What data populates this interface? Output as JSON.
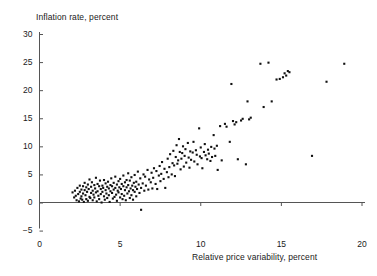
{
  "chart_data": {
    "type": "scatter",
    "title": "",
    "xlabel": "Relative price variability, percent",
    "ylabel": "Inflation rate, percent",
    "xlim": [
      0,
      20
    ],
    "ylim": [
      -5,
      30
    ],
    "xticks": [
      0,
      5,
      10,
      15,
      20
    ],
    "yticks": [
      -5,
      0,
      5,
      10,
      15,
      20,
      25,
      30
    ],
    "xtick_labels": [
      "0",
      "5",
      "10",
      "15",
      "20"
    ],
    "ytick_labels": [
      "−5",
      "0",
      "5",
      "10",
      "15",
      "20",
      "25",
      "30"
    ],
    "grid": false,
    "legend": "none",
    "zero_line": true,
    "marker": "filled-square",
    "marker_color": "#111111",
    "marker_size_px": 2.1,
    "n_points": 231,
    "points": [
      [
        2.05,
        1.8
      ],
      [
        2.15,
        0.9
      ],
      [
        2.2,
        2.1
      ],
      [
        2.25,
        1.2
      ],
      [
        2.3,
        0.4
      ],
      [
        2.35,
        2.6
      ],
      [
        2.4,
        1.5
      ],
      [
        2.45,
        0.2
      ],
      [
        2.5,
        1.9
      ],
      [
        2.5,
        3.0
      ],
      [
        2.55,
        0.7
      ],
      [
        2.6,
        2.3
      ],
      [
        2.6,
        1.1
      ],
      [
        2.65,
        0.5
      ],
      [
        2.7,
        2.9
      ],
      [
        2.7,
        1.6
      ],
      [
        2.75,
        0.1
      ],
      [
        2.8,
        2.2
      ],
      [
        2.8,
        3.5
      ],
      [
        2.85,
        1.3
      ],
      [
        2.9,
        0.6
      ],
      [
        2.9,
        2.7
      ],
      [
        2.95,
        1.9
      ],
      [
        3.0,
        0.3
      ],
      [
        3.0,
        3.2
      ],
      [
        3.05,
        2.4
      ],
      [
        3.1,
        1.0
      ],
      [
        3.1,
        4.1
      ],
      [
        3.15,
        0.8
      ],
      [
        3.2,
        2.8
      ],
      [
        3.2,
        1.7
      ],
      [
        3.25,
        3.6
      ],
      [
        3.3,
        0.4
      ],
      [
        3.3,
        2.1
      ],
      [
        3.35,
        1.4
      ],
      [
        3.4,
        3.1
      ],
      [
        3.4,
        0.9
      ],
      [
        3.45,
        2.5
      ],
      [
        3.5,
        1.8
      ],
      [
        3.5,
        4.4
      ],
      [
        3.55,
        0.2
      ],
      [
        3.6,
        3.3
      ],
      [
        3.6,
        2.0
      ],
      [
        3.65,
        1.2
      ],
      [
        3.7,
        2.9
      ],
      [
        3.7,
        0.6
      ],
      [
        3.75,
        3.9
      ],
      [
        3.8,
        1.5
      ],
      [
        3.8,
        2.4
      ],
      [
        3.85,
        0.0
      ],
      [
        3.9,
        3.0
      ],
      [
        3.9,
        1.9
      ],
      [
        3.95,
        2.6
      ],
      [
        4.0,
        1.1
      ],
      [
        4.0,
        4.0
      ],
      [
        4.05,
        0.5
      ],
      [
        4.1,
        2.2
      ],
      [
        4.1,
        3.4
      ],
      [
        4.15,
        1.6
      ],
      [
        4.2,
        2.8
      ],
      [
        4.2,
        0.8
      ],
      [
        4.25,
        3.7
      ],
      [
        4.3,
        1.3
      ],
      [
        4.3,
        2.5
      ],
      [
        4.35,
        0.1
      ],
      [
        4.4,
        3.1
      ],
      [
        4.4,
        2.0
      ],
      [
        4.45,
        4.3
      ],
      [
        4.5,
        1.7
      ],
      [
        4.5,
        2.9
      ],
      [
        4.55,
        0.7
      ],
      [
        4.6,
        3.5
      ],
      [
        4.6,
        2.3
      ],
      [
        4.65,
        1.0
      ],
      [
        4.7,
        4.6
      ],
      [
        4.7,
        2.6
      ],
      [
        4.75,
        1.4
      ],
      [
        4.8,
        3.2
      ],
      [
        4.8,
        0.3
      ],
      [
        4.85,
        2.1
      ],
      [
        4.9,
        3.8
      ],
      [
        4.9,
        1.8
      ],
      [
        4.95,
        2.7
      ],
      [
        5.0,
        0.9
      ],
      [
        5.0,
        4.2
      ],
      [
        5.05,
        2.4
      ],
      [
        5.1,
        1.5
      ],
      [
        5.1,
        3.3
      ],
      [
        5.15,
        0.6
      ],
      [
        5.2,
        2.9
      ],
      [
        5.2,
        4.8
      ],
      [
        5.25,
        1.2
      ],
      [
        5.3,
        3.6
      ],
      [
        5.3,
        2.2
      ],
      [
        5.35,
        0.4
      ],
      [
        5.4,
        4.0
      ],
      [
        5.4,
        2.7
      ],
      [
        5.45,
        1.6
      ],
      [
        5.5,
        3.1
      ],
      [
        5.5,
        5.2
      ],
      [
        5.55,
        2.0
      ],
      [
        5.6,
        0.8
      ],
      [
        5.6,
        3.9
      ],
      [
        5.65,
        2.5
      ],
      [
        5.7,
        1.3
      ],
      [
        5.7,
        4.5
      ],
      [
        5.75,
        3.0
      ],
      [
        5.8,
        2.2
      ],
      [
        5.8,
        0.5
      ],
      [
        5.85,
        3.5
      ],
      [
        5.9,
        1.9
      ],
      [
        5.9,
        4.9
      ],
      [
        5.95,
        2.8
      ],
      [
        6.0,
        1.1
      ],
      [
        6.0,
        3.7
      ],
      [
        6.05,
        2.4
      ],
      [
        6.1,
        5.5
      ],
      [
        6.15,
        3.2
      ],
      [
        6.2,
        1.7
      ],
      [
        6.25,
        4.3
      ],
      [
        6.3,
        2.6
      ],
      [
        6.3,
        -1.3
      ],
      [
        6.4,
        3.4
      ],
      [
        6.45,
        5.0
      ],
      [
        6.5,
        2.1
      ],
      [
        6.55,
        4.6
      ],
      [
        6.6,
        3.0
      ],
      [
        6.7,
        5.8
      ],
      [
        6.75,
        2.3
      ],
      [
        6.8,
        4.1
      ],
      [
        6.9,
        3.6
      ],
      [
        6.95,
        5.3
      ],
      [
        7.0,
        2.5
      ],
      [
        7.05,
        4.4
      ],
      [
        7.1,
        6.1
      ],
      [
        7.2,
        3.3
      ],
      [
        7.25,
        5.6
      ],
      [
        7.3,
        2.4
      ],
      [
        7.4,
        4.8
      ],
      [
        7.45,
        6.5
      ],
      [
        7.5,
        3.8
      ],
      [
        7.55,
        5.1
      ],
      [
        7.6,
        7.2
      ],
      [
        7.7,
        4.2
      ],
      [
        7.75,
        6.0
      ],
      [
        7.8,
        2.6
      ],
      [
        7.9,
        5.4
      ],
      [
        7.95,
        7.8
      ],
      [
        8.0,
        4.5
      ],
      [
        8.05,
        6.3
      ],
      [
        8.1,
        8.6
      ],
      [
        8.2,
        5.0
      ],
      [
        8.25,
        7.0
      ],
      [
        8.3,
        9.2
      ],
      [
        8.35,
        6.6
      ],
      [
        8.4,
        4.7
      ],
      [
        8.45,
        8.1
      ],
      [
        8.5,
        10.2
      ],
      [
        8.55,
        6.9
      ],
      [
        8.6,
        7.5
      ],
      [
        8.65,
        11.3
      ],
      [
        8.7,
        9.0
      ],
      [
        8.75,
        5.9
      ],
      [
        8.8,
        7.8
      ],
      [
        8.85,
        8.8
      ],
      [
        8.9,
        10.0
      ],
      [
        8.95,
        6.4
      ],
      [
        9.0,
        8.3
      ],
      [
        9.05,
        9.5
      ],
      [
        9.1,
        7.1
      ],
      [
        9.2,
        10.6
      ],
      [
        9.25,
        8.0
      ],
      [
        9.3,
        6.2
      ],
      [
        9.35,
        9.1
      ],
      [
        9.4,
        7.6
      ],
      [
        9.5,
        8.9
      ],
      [
        9.55,
        10.8
      ],
      [
        9.6,
        7.3
      ],
      [
        9.7,
        9.3
      ],
      [
        9.75,
        8.5
      ],
      [
        9.8,
        6.8
      ],
      [
        9.9,
        13.2
      ],
      [
        9.95,
        8.2
      ],
      [
        10.0,
        9.8
      ],
      [
        10.05,
        7.9
      ],
      [
        10.1,
        6.1
      ],
      [
        10.2,
        9.0
      ],
      [
        10.25,
        10.4
      ],
      [
        10.3,
        8.4
      ],
      [
        10.4,
        7.7
      ],
      [
        10.45,
        9.4
      ],
      [
        10.5,
        8.7
      ],
      [
        10.6,
        7.4
      ],
      [
        10.65,
        9.9
      ],
      [
        10.7,
        8.1
      ],
      [
        10.8,
        12.0
      ],
      [
        10.85,
        9.6
      ],
      [
        10.9,
        8.3
      ],
      [
        11.0,
        10.1
      ],
      [
        11.05,
        5.8
      ],
      [
        11.2,
        13.6
      ],
      [
        11.3,
        7.5
      ],
      [
        11.5,
        14.0
      ],
      [
        11.6,
        13.5
      ],
      [
        11.8,
        10.8
      ],
      [
        11.9,
        21.1
      ],
      [
        12.0,
        14.5
      ],
      [
        12.1,
        13.9
      ],
      [
        12.2,
        14.3
      ],
      [
        12.3,
        7.7
      ],
      [
        12.5,
        14.6
      ],
      [
        12.6,
        14.9
      ],
      [
        12.8,
        6.8
      ],
      [
        12.9,
        18.0
      ],
      [
        13.0,
        14.8
      ],
      [
        13.1,
        15.1
      ],
      [
        13.7,
        24.7
      ],
      [
        13.9,
        17.0
      ],
      [
        14.2,
        24.9
      ],
      [
        14.4,
        18.0
      ],
      [
        14.7,
        21.9
      ],
      [
        14.9,
        22.0
      ],
      [
        15.1,
        22.3
      ],
      [
        15.2,
        23.0
      ],
      [
        15.3,
        22.6
      ],
      [
        15.4,
        23.4
      ],
      [
        15.5,
        23.2
      ],
      [
        16.9,
        8.3
      ],
      [
        17.8,
        21.5
      ],
      [
        18.9,
        24.7
      ]
    ]
  }
}
